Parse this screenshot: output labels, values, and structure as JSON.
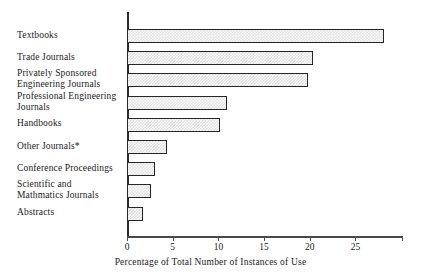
{
  "chart_data": {
    "type": "bar",
    "orientation": "horizontal",
    "title": "",
    "xlabel": "Percentage of Total Number of Instances of Use",
    "ylabel": "",
    "xlim": [
      0,
      30.2
    ],
    "ylim": [
      0,
      9
    ],
    "grid": false,
    "legend": false,
    "xticks": [
      0,
      5,
      10,
      15,
      20,
      25
    ],
    "xtick_labels": [
      "0",
      "5",
      "10",
      "15",
      "20",
      "25"
    ],
    "categories": [
      "Textbooks",
      "Trade Journals",
      "Privately Sponsored Engineering Journals",
      "Professional Engineering Journals",
      "Handbooks",
      "Other Journals*",
      "Conference Proceedings",
      "Scientific and Mathmatics  Journals",
      "Abstracts"
    ],
    "category_lines": [
      [
        "Textbooks"
      ],
      [
        "Trade Journals"
      ],
      [
        "Privately Sponsored",
        "Engineering Journals"
      ],
      [
        "Professional Engineering",
        "Journals"
      ],
      [
        "Handbooks"
      ],
      [
        "Other Journals*"
      ],
      [
        "Conference Proceedings"
      ],
      [
        "Scientific and",
        "Mathmatics  Journals"
      ],
      [
        "Abstracts"
      ]
    ],
    "values": [
      28.1,
      20.3,
      19.8,
      10.9,
      10.2,
      4.4,
      3.1,
      2.6,
      1.7
    ],
    "bar_fill_color": "#e4e4e4",
    "bar_edge_color": "#262626",
    "axis_color": "#2b2b2b",
    "footnote": "*"
  }
}
